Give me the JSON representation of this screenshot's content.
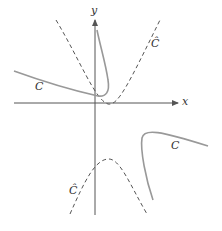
{
  "diagram": {
    "axes": {
      "x_label": "x",
      "y_label": "y",
      "color": "#555555"
    },
    "curves": [
      {
        "name": "C",
        "label": "C",
        "style": "solid",
        "color": "#999999",
        "description": "hyperbola-like curve with two branches (upper-left and lower-right)"
      },
      {
        "name": "C-hat",
        "label": "Ĉ",
        "style": "dashed",
        "color": "#555555",
        "description": "parabola-like dashed curve with two branches (upward-opening and downward-opening)"
      }
    ],
    "labels": {
      "c_upper": "C",
      "c_lower": "C",
      "chat_upper": "Ĉ",
      "chat_lower": "Ĉ"
    }
  }
}
